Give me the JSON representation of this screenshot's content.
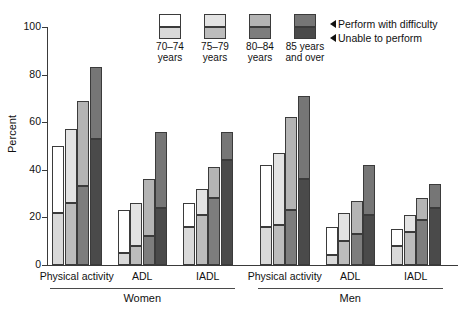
{
  "chart_data": {
    "type": "bar",
    "title": "",
    "subtitle": "",
    "xlabel": "",
    "ylabel": "Percent",
    "ylim": [
      0,
      100
    ],
    "yticks": [
      0,
      20,
      40,
      60,
      80,
      100
    ],
    "grid": false,
    "stacked": true,
    "legend_position": "top-center",
    "panel_labels": [
      "Women",
      "Men"
    ],
    "categories": [
      "Physical activity",
      "ADL",
      "IADL"
    ],
    "series": [
      {
        "name": "70–74 years",
        "color_difficulty": "#ffffff",
        "color_unable": "#d9d9d9"
      },
      {
        "name": "75–79 years",
        "color_difficulty": "#e3e3e3",
        "color_unable": "#bcbcbc"
      },
      {
        "name": "80–84 years",
        "color_difficulty": "#b4b4b4",
        "color_unable": "#7d7d7d"
      },
      {
        "name": "85 years and over",
        "color_difficulty": "#767676",
        "color_unable": "#4a4a4a"
      }
    ],
    "segment_labels": [
      "Perform with difficulty",
      "Unable to perform"
    ],
    "panels": [
      {
        "panel": "Women",
        "groups": [
          {
            "category": "Physical activity",
            "bars": [
              {
                "series": "70–74 years",
                "unable": 22,
                "total": 50
              },
              {
                "series": "75–79 years",
                "unable": 26,
                "total": 57
              },
              {
                "series": "80–84 years",
                "unable": 33,
                "total": 69
              },
              {
                "series": "85 years and over",
                "unable": 53,
                "total": 83
              }
            ]
          },
          {
            "category": "ADL",
            "bars": [
              {
                "series": "70–74 years",
                "unable": 5,
                "total": 23
              },
              {
                "series": "75–79 years",
                "unable": 8,
                "total": 26
              },
              {
                "series": "80–84 years",
                "unable": 12,
                "total": 36
              },
              {
                "series": "85 years and over",
                "unable": 24,
                "total": 56
              }
            ]
          },
          {
            "category": "IADL",
            "bars": [
              {
                "series": "70–74 years",
                "unable": 16,
                "total": 26
              },
              {
                "series": "75–79 years",
                "unable": 21,
                "total": 32
              },
              {
                "series": "80–84 years",
                "unable": 28,
                "total": 41
              },
              {
                "series": "85 years and over",
                "unable": 44,
                "total": 56
              }
            ]
          }
        ]
      },
      {
        "panel": "Men",
        "groups": [
          {
            "category": "Physical activity",
            "bars": [
              {
                "series": "70–74 years",
                "unable": 16,
                "total": 42
              },
              {
                "series": "75–79 years",
                "unable": 17,
                "total": 47
              },
              {
                "series": "80–84 years",
                "unable": 23,
                "total": 62
              },
              {
                "series": "85 years and over",
                "unable": 36,
                "total": 71
              }
            ]
          },
          {
            "category": "ADL",
            "bars": [
              {
                "series": "70–74 years",
                "unable": 4,
                "total": 16
              },
              {
                "series": "75–79 years",
                "unable": 10,
                "total": 22
              },
              {
                "series": "80–84 years",
                "unable": 13,
                "total": 27
              },
              {
                "series": "85 years and over",
                "unable": 21,
                "total": 42
              }
            ]
          },
          {
            "category": "IADL",
            "bars": [
              {
                "series": "70–74 years",
                "unable": 8,
                "total": 15
              },
              {
                "series": "75–79 years",
                "unable": 14,
                "total": 21
              },
              {
                "series": "80–84 years",
                "unable": 19,
                "total": 28
              },
              {
                "series": "85 years and over",
                "unable": 24,
                "total": 34
              }
            ]
          }
        ]
      }
    ]
  },
  "axis": {
    "y_title": "Percent",
    "y_tick_labels": [
      "0",
      "20",
      "40",
      "60",
      "80",
      "100"
    ]
  },
  "legend": {
    "items": [
      {
        "label_line1": "70–74",
        "label_line2": "years"
      },
      {
        "label_line1": "75–79",
        "label_line2": "years"
      },
      {
        "label_line1": "80–84",
        "label_line2": "years"
      },
      {
        "label_line1": "85 years",
        "label_line2": "and over"
      }
    ],
    "annotations": [
      "Perform with difficulty",
      "Unable to perform"
    ]
  },
  "x_axis": {
    "panels": [
      {
        "name": "Women",
        "categories": [
          "Physical activity",
          "ADL",
          "IADL"
        ]
      },
      {
        "name": "Men",
        "categories": [
          "Physical activity",
          "ADL",
          "IADL"
        ]
      }
    ]
  }
}
